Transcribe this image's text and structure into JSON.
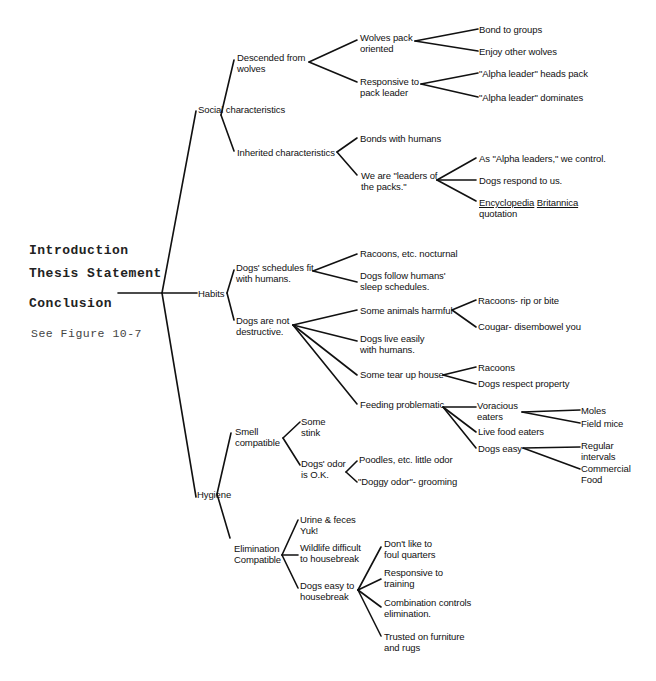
{
  "left_panel": {
    "introduction": "Introduction",
    "thesis": "Thesis Statement",
    "conclusion": "Conclusion",
    "figure_ref": "See Figure 10-7"
  },
  "tree": {
    "social": {
      "label": "Social characteristics",
      "descended": {
        "l1": "Descended from",
        "l2": "wolves",
        "pack_oriented": {
          "l1": "Wolves pack",
          "l2": "oriented",
          "a": "Bond to groups",
          "b": "Enjoy other wolves"
        },
        "responsive": {
          "l1": "Responsive to",
          "l2": "pack leader",
          "a": "\"Alpha leader\" heads pack",
          "b": "\"Alpha leader\" dominates"
        }
      },
      "inherited": {
        "label": "Inherited characteristics",
        "bonds": "Bonds with humans",
        "leaders": {
          "l1": "We are \"leaders of",
          "l2": "the packs.\"",
          "a": "As \"Alpha leaders,\" we control.",
          "b": "Dogs respond to us.",
          "c1": "Encyclopedia",
          "c2": "Britannica",
          "c3": "quotation"
        }
      }
    },
    "habits": {
      "label": "Habits",
      "schedules": {
        "l1": "Dogs' schedules fit",
        "l2": "with humans.",
        "a": "Racoons, etc. nocturnal",
        "b1": "Dogs follow humans'",
        "b2": "sleep schedules."
      },
      "not_destructive": {
        "l1": "Dogs are not",
        "l2": "destructive.",
        "harmful": {
          "label": "Some animals harmful",
          "a": "Racoons- rip or bite",
          "b": "Cougar- disembowel you"
        },
        "live_easily": {
          "l1": "Dogs live easily",
          "l2": "with humans."
        },
        "tear_up": {
          "label": "Some tear up house",
          "a": "Racoons",
          "b": "Dogs respect property"
        },
        "feeding": {
          "label": "Feeding problematic",
          "voracious": {
            "l1": "Voracious",
            "l2": "eaters",
            "a": "Moles",
            "b": "Field mice"
          },
          "live_food": "Live food eaters",
          "dogs_easy": {
            "label": "Dogs easy",
            "a1": "Regular",
            "a2": "intervals",
            "b1": "Commercial",
            "b2": "Food"
          }
        }
      }
    },
    "hygiene": {
      "label": "Hygiene",
      "smell": {
        "l1": "Smell",
        "l2": "compatible",
        "stink": {
          "l1": "Some",
          "l2": "stink"
        },
        "odor": {
          "l1": "Dogs' odor",
          "l2": "is O.K.",
          "a": "Poodles, etc. little odor",
          "b": "\"Doggy odor\"- grooming"
        }
      },
      "elimination": {
        "l1": "Elimination",
        "l2": "Compatible",
        "urine": {
          "l1": "Urine & feces",
          "l2": "Yuk!"
        },
        "wildlife": {
          "l1": "Wildlife difficult",
          "l2": "to housebreak"
        },
        "easy": {
          "l1": "Dogs easy to",
          "l2": "housebreak",
          "a1": "Don't like to",
          "a2": "foul quarters",
          "b1": "Responsive to",
          "b2": "training",
          "c1": "Combination controls",
          "c2": "elimination.",
          "d1": "Trusted on furniture",
          "d2": "and rugs"
        }
      }
    }
  }
}
